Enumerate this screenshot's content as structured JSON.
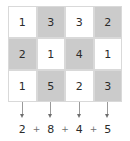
{
  "figure": {
    "type": "column-sum-grid",
    "rows": 3,
    "columns": 4,
    "grid": [
      [
        {
          "value": "1",
          "shade": "white"
        },
        {
          "value": "3",
          "shade": "gray"
        },
        {
          "value": "3",
          "shade": "white"
        },
        {
          "value": "2",
          "shade": "gray"
        }
      ],
      [
        {
          "value": "2",
          "shade": "gray"
        },
        {
          "value": "1",
          "shade": "white"
        },
        {
          "value": "4",
          "shade": "gray"
        },
        {
          "value": "1",
          "shade": "white"
        }
      ],
      [
        {
          "value": "1",
          "shade": "white"
        },
        {
          "value": "5",
          "shade": "gray"
        },
        {
          "value": "2",
          "shade": "white"
        },
        {
          "value": "3",
          "shade": "gray"
        }
      ]
    ],
    "arrows": [
      {
        "name": "down-arrow-column-1",
        "direction": "down"
      },
      {
        "name": "down-arrow-column-2",
        "direction": "down"
      },
      {
        "name": "down-arrow-column-3",
        "direction": "down"
      },
      {
        "name": "down-arrow-column-4",
        "direction": "down"
      }
    ],
    "sum_row": {
      "terms": [
        "2",
        "8",
        "4",
        "5"
      ],
      "operator": "+"
    },
    "colors": {
      "cell_white": "#ffffff",
      "cell_gray": "#cbcbcb",
      "cell_border": "#d9d9d9",
      "text": "#2b2b2b",
      "arrow": "#6e6e6e",
      "operator": "#6e6e6e",
      "background": "#ffffff"
    }
  }
}
